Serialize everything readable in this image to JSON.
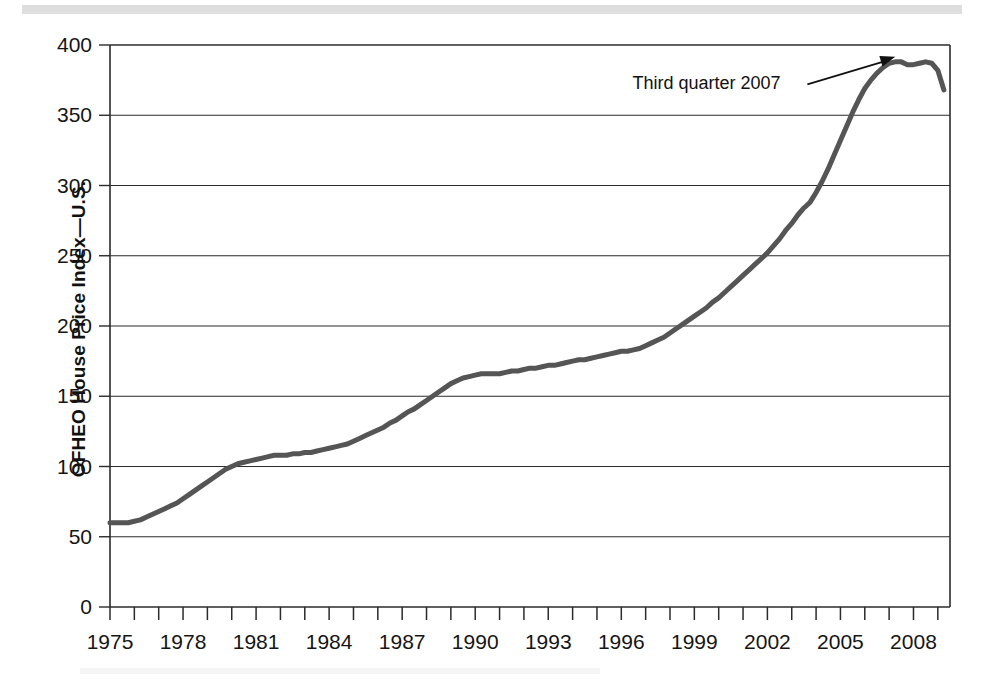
{
  "figure": {
    "y_axis_title": "OFHEO House Price Index—U.S.",
    "annotation_text": "Third quarter 2007"
  },
  "chart_data": {
    "type": "line",
    "title": "",
    "subtitle": "",
    "xlabel": "",
    "ylabel": "OFHEO House Price Index—U.S.",
    "xlim": [
      1975,
      2009.5
    ],
    "ylim": [
      0,
      400
    ],
    "y_ticks": [
      0,
      50,
      100,
      150,
      200,
      250,
      300,
      350,
      400
    ],
    "y_tick_labels": [
      "0",
      "50",
      "100",
      "150",
      "200",
      "250",
      "300",
      "350",
      "400"
    ],
    "x_ticks": [
      1975,
      1976,
      1977,
      1978,
      1979,
      1980,
      1981,
      1982,
      1983,
      1984,
      1985,
      1986,
      1987,
      1988,
      1989,
      1990,
      1991,
      1992,
      1993,
      1994,
      1995,
      1996,
      1997,
      1998,
      1999,
      2000,
      2001,
      2002,
      2003,
      2004,
      2005,
      2006,
      2007,
      2008,
      2009
    ],
    "x_tick_labels": [
      "1975",
      "1978",
      "1981",
      "1984",
      "1987",
      "1990",
      "1993",
      "1996",
      "1999",
      "2002",
      "2005",
      "2008"
    ],
    "x_tick_label_years": [
      1975,
      1978,
      1981,
      1984,
      1987,
      1990,
      1993,
      1996,
      1999,
      2002,
      2005,
      2008
    ],
    "grid": "horizontal",
    "legend": "none",
    "line_color": "#555555",
    "line_width": 5,
    "annotations": [
      {
        "text": "Third quarter 2007",
        "point_x": 2007.5,
        "point_y": 388,
        "label_x": 2002.0,
        "label_y": 372
      }
    ],
    "series": [
      {
        "name": "OFHEO House Price Index—U.S.",
        "x": [
          1975.0,
          1975.25,
          1975.5,
          1975.75,
          1976.0,
          1976.25,
          1976.5,
          1976.75,
          1977.0,
          1977.25,
          1977.5,
          1977.75,
          1978.0,
          1978.25,
          1978.5,
          1978.75,
          1979.0,
          1979.25,
          1979.5,
          1979.75,
          1980.0,
          1980.25,
          1980.5,
          1980.75,
          1981.0,
          1981.25,
          1981.5,
          1981.75,
          1982.0,
          1982.25,
          1982.5,
          1982.75,
          1983.0,
          1983.25,
          1983.5,
          1983.75,
          1984.0,
          1984.25,
          1984.5,
          1984.75,
          1985.0,
          1985.25,
          1985.5,
          1985.75,
          1986.0,
          1986.25,
          1986.5,
          1986.75,
          1987.0,
          1987.25,
          1987.5,
          1987.75,
          1988.0,
          1988.25,
          1988.5,
          1988.75,
          1989.0,
          1989.25,
          1989.5,
          1989.75,
          1990.0,
          1990.25,
          1990.5,
          1990.75,
          1991.0,
          1991.25,
          1991.5,
          1991.75,
          1992.0,
          1992.25,
          1992.5,
          1992.75,
          1993.0,
          1993.25,
          1993.5,
          1993.75,
          1994.0,
          1994.25,
          1994.5,
          1994.75,
          1995.0,
          1995.25,
          1995.5,
          1995.75,
          1996.0,
          1996.25,
          1996.5,
          1996.75,
          1997.0,
          1997.25,
          1997.5,
          1997.75,
          1998.0,
          1998.25,
          1998.5,
          1998.75,
          1999.0,
          1999.25,
          1999.5,
          1999.75,
          2000.0,
          2000.25,
          2000.5,
          2000.75,
          2001.0,
          2001.25,
          2001.5,
          2001.75,
          2002.0,
          2002.25,
          2002.5,
          2002.75,
          2003.0,
          2003.25,
          2003.5,
          2003.75,
          2004.0,
          2004.25,
          2004.5,
          2004.75,
          2005.0,
          2005.25,
          2005.5,
          2005.75,
          2006.0,
          2006.25,
          2006.5,
          2006.75,
          2007.0,
          2007.25,
          2007.5,
          2007.75,
          2008.0,
          2008.25,
          2008.5,
          2008.75,
          2009.0,
          2009.25
        ],
        "y": [
          60,
          60,
          60,
          60,
          61,
          62,
          64,
          66,
          68,
          70,
          72,
          74,
          77,
          80,
          83,
          86,
          89,
          92,
          95,
          98,
          100,
          102,
          103,
          104,
          105,
          106,
          107,
          108,
          108,
          108,
          109,
          109,
          110,
          110,
          111,
          112,
          113,
          114,
          115,
          116,
          118,
          120,
          122,
          124,
          126,
          128,
          131,
          133,
          136,
          139,
          141,
          144,
          147,
          150,
          153,
          156,
          159,
          161,
          163,
          164,
          165,
          166,
          166,
          166,
          166,
          167,
          168,
          168,
          169,
          170,
          170,
          171,
          172,
          172,
          173,
          174,
          175,
          176,
          176,
          177,
          178,
          179,
          180,
          181,
          182,
          182,
          183,
          184,
          186,
          188,
          190,
          192,
          195,
          198,
          201,
          204,
          207,
          210,
          213,
          217,
          220,
          224,
          228,
          232,
          236,
          240,
          244,
          248,
          252,
          257,
          262,
          268,
          273,
          279,
          284,
          288,
          295,
          303,
          312,
          322,
          332,
          342,
          352,
          361,
          369,
          375,
          380,
          384,
          387,
          388,
          388,
          386,
          386,
          387,
          388,
          387,
          382,
          368
        ]
      }
    ]
  }
}
